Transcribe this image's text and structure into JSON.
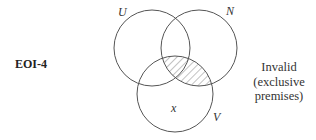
{
  "diagram": {
    "id_label": "EOI-4",
    "verdict": {
      "line1": "Invalid",
      "line2": "(exclusive",
      "line3": "premises)"
    },
    "circles": [
      {
        "name": "U",
        "cx": 152,
        "cy": 48,
        "r": 38
      },
      {
        "name": "N",
        "cx": 199,
        "cy": 48,
        "r": 38
      },
      {
        "name": "V",
        "cx": 175,
        "cy": 94,
        "r": 38
      }
    ],
    "marks": {
      "x_label": "x",
      "shaded_region": "U∩N∩V and N∩V (shaded)"
    },
    "colors": {
      "stroke": "#555555",
      "hatch": "#777777",
      "background": "#ffffff"
    }
  }
}
